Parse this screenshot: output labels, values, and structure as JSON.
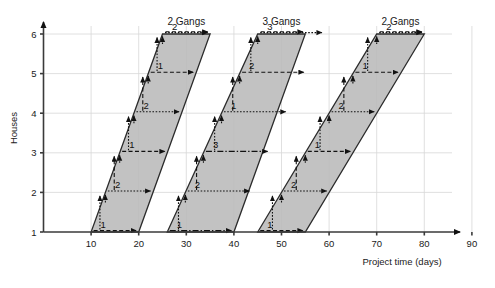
{
  "chart_data": {
    "type": "area",
    "title": "",
    "xlabel": "Project time (days)",
    "ylabel": "Houses",
    "xlim": [
      0,
      95
    ],
    "ylim": [
      1,
      6
    ],
    "xticks": [
      10,
      20,
      30,
      40,
      50,
      60,
      70,
      80,
      90
    ],
    "yticks": [
      1,
      2,
      3,
      4,
      5,
      6
    ],
    "grid": true,
    "legend": "none",
    "annotations": [
      "2 Gangs",
      "3 Gangs",
      "2 Gangs"
    ],
    "bands": [
      {
        "name": "activity-band-1",
        "gangs_label": "2 Gangs",
        "gangs": 2,
        "base_start_day": 10,
        "base_end_day": 20,
        "top_start_day": 25,
        "top_end_day": 35,
        "start_house": 1,
        "end_house": 6,
        "gang_sequence": [
          "1",
          "2",
          "1",
          "2",
          "1",
          "2"
        ]
      },
      {
        "name": "activity-band-2",
        "gangs_label": "3 Gangs",
        "gangs": 3,
        "base_start_day": 26,
        "base_end_day": 40,
        "top_start_day": 45,
        "top_end_day": 55,
        "start_house": 1,
        "end_house": 6,
        "gang_sequence": [
          "1",
          "2",
          "3",
          "1",
          "2",
          "3"
        ]
      },
      {
        "name": "activity-band-3",
        "gangs_label": "2 Gangs",
        "gangs": 2,
        "base_start_day": 45,
        "base_end_day": 55,
        "top_start_day": 70,
        "top_end_day": 80,
        "start_house": 1,
        "end_house": 6,
        "gang_sequence": [
          "1",
          "2",
          "1",
          "2",
          "1",
          "2"
        ]
      }
    ]
  },
  "axes": {
    "x": {
      "title": "Project time (days)",
      "ticks": [
        "10",
        "20",
        "30",
        "40",
        "50",
        "60",
        "70",
        "80",
        "90"
      ]
    },
    "y": {
      "title": "Houses",
      "ticks": [
        "1",
        "2",
        "3",
        "4",
        "5",
        "6"
      ]
    }
  },
  "headers": [
    {
      "label": "2 Gangs"
    },
    {
      "label": "3 Gangs"
    },
    {
      "label": "2 Gangs"
    }
  ],
  "colors": {
    "band_fill": "#b9b9b9",
    "band_stroke": "#2b2b2b",
    "grid": "#d8d8d8",
    "axis": "#3a3a3a",
    "text": "#1a1a1a"
  }
}
